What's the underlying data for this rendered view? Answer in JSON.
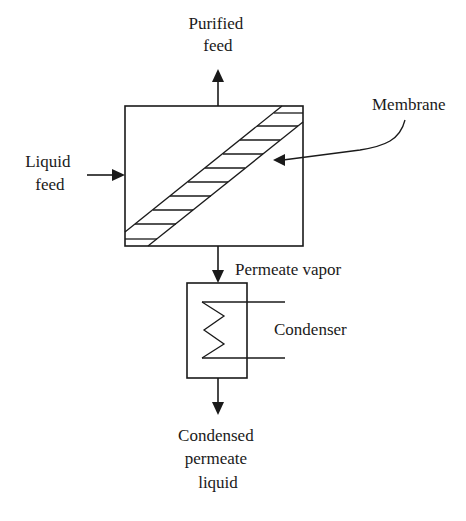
{
  "diagram": {
    "type": "process-flow",
    "title": "",
    "labels": {
      "purified_feed": [
        "Purified",
        "feed"
      ],
      "liquid_feed": [
        "Liquid",
        "feed"
      ],
      "membrane": "Membrane",
      "permeate_vapor": "Permeate vapor",
      "condenser": "Condenser",
      "condensed_permeate_liquid": [
        "Condensed",
        "permeate",
        "liquid"
      ]
    },
    "nodes": [
      {
        "id": "membrane-module",
        "label": "Membrane module (with diagonal hatched membrane)"
      },
      {
        "id": "condenser",
        "label": "Condenser"
      }
    ],
    "edges": [
      {
        "from": "Liquid feed",
        "to": "membrane-module"
      },
      {
        "from": "membrane-module",
        "to": "Purified feed"
      },
      {
        "from": "membrane-module",
        "to": "condenser",
        "label": "Permeate vapor"
      },
      {
        "from": "condenser",
        "to": "Condensed permeate liquid"
      }
    ],
    "colors": {
      "stroke": "#1a1a1a",
      "background": "#ffffff"
    }
  }
}
